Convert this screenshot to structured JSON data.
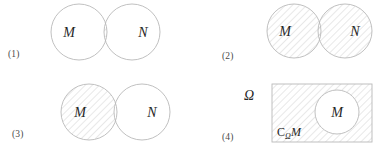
{
  "figure": {
    "background_color": "#ffffff",
    "outline_color": "#b9b9b9",
    "hatch_color": "#c9c9c9",
    "text_color": "#262626",
    "label_color": "#4a4a4a"
  },
  "panels": [
    {
      "id": "panel-1",
      "number": "(1)",
      "meaning": "intersection",
      "shaded_region": "M-and-N-overlap",
      "sets": [
        {
          "name": "M",
          "cx": 79,
          "cy": 32,
          "r": 28,
          "hatched": false
        },
        {
          "name": "N",
          "cx": 132,
          "cy": 32,
          "r": 28,
          "hatched": false
        }
      ]
    },
    {
      "id": "panel-2",
      "number": "(2)",
      "meaning": "union",
      "shaded_region": "M-and-N-both-circles",
      "sets": [
        {
          "name": "M",
          "cx": 294,
          "cy": 31,
          "r": 27,
          "hatched": true
        },
        {
          "name": "N",
          "cx": 345,
          "cy": 31,
          "r": 27,
          "hatched": true
        }
      ]
    },
    {
      "id": "panel-3",
      "number": "(3)",
      "meaning": "difference",
      "shaded_region": "M-minus-N",
      "sets": [
        {
          "name": "M",
          "cx": 89,
          "cy": 112,
          "r": 28,
          "hatched": true
        },
        {
          "name": "N",
          "cx": 142,
          "cy": 112,
          "r": 28,
          "hatched": false
        }
      ]
    },
    {
      "id": "panel-4",
      "number": "(4)",
      "meaning": "complement",
      "shaded_region": "omega-minus-M",
      "universe": {
        "name": "Ω",
        "x": 272,
        "y": 84,
        "width": 100,
        "height": 58,
        "hatched": true,
        "label_x": 249,
        "label_y": 100
      },
      "complement_label": {
        "symbol": "C",
        "subscript": "Ω",
        "operand": "M",
        "x": 277,
        "y": 136
      },
      "sets": [
        {
          "name": "M",
          "cx": 337,
          "cy": 112,
          "r": 22,
          "hatched": false
        }
      ]
    }
  ]
}
